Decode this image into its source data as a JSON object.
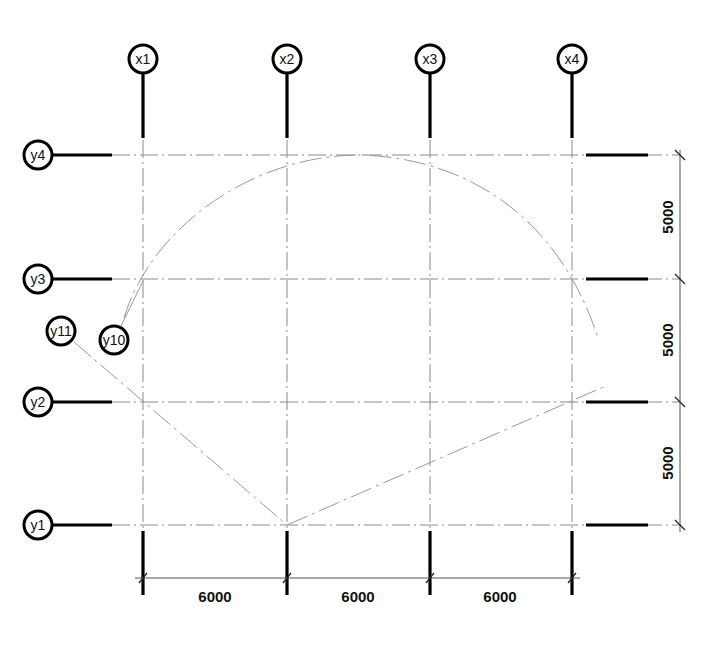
{
  "drawing": {
    "type": "structural-grid-plan",
    "axes_x": [
      {
        "id": "x1",
        "label": "x1",
        "px": 143
      },
      {
        "id": "x2",
        "label": "x2",
        "px": 287
      },
      {
        "id": "x3",
        "label": "x3",
        "px": 430
      },
      {
        "id": "x4",
        "label": "x4",
        "px": 572
      }
    ],
    "axes_y": [
      {
        "id": "y4",
        "label": "y4",
        "py": 155
      },
      {
        "id": "y3",
        "label": "y3",
        "py": 279
      },
      {
        "id": "y2",
        "label": "y2",
        "py": 402
      },
      {
        "id": "y1",
        "label": "y1",
        "py": 525
      }
    ],
    "aux_axes": [
      {
        "id": "y11",
        "label": "y11",
        "description": "inclined straight axis from y11 bubble through x1/y2 to x2/y1"
      },
      {
        "id": "y10",
        "label": "y10",
        "description": "arc axis from y10 bubble over top past x4/y3"
      }
    ],
    "extra_lines": [
      {
        "description": "inclined straight line from x2/y1 up to the right past x4/y2"
      }
    ],
    "dimensions_horizontal": {
      "segments": [
        "6000",
        "6000",
        "6000"
      ]
    },
    "dimensions_vertical": {
      "segments": [
        "5000",
        "5000",
        "5000"
      ]
    },
    "colors": {
      "grid_line": "#8a8a8a",
      "bubble_stroke": "#000000",
      "stub": "#000000",
      "background": "#ffffff"
    }
  }
}
